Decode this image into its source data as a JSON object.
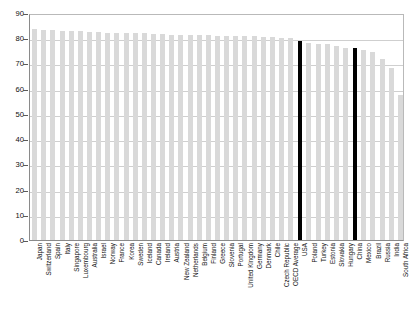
{
  "chart_data": {
    "type": "bar",
    "title": "",
    "xlabel": "",
    "ylabel": "Life expectancy at birth for total population",
    "ylim": [
      0,
      90
    ],
    "yticks": [
      0,
      10,
      20,
      30,
      40,
      50,
      60,
      70,
      80,
      90
    ],
    "grid": true,
    "legend": "none",
    "highlight_color": "#000000",
    "bar_color": "#d9d9d9",
    "highlighted_categories": [
      "USA",
      "China"
    ],
    "categories": [
      "Japan",
      "Switzerland",
      "Spain",
      "Italy",
      "Singapore",
      "Luxembourg",
      "Australia",
      "Israel",
      "Norway",
      "France",
      "Korea",
      "Sweden",
      "Iceland",
      "Canada",
      "Ireland",
      "Austria",
      "New Zealand",
      "Netherlands",
      "Belgium",
      "Finland",
      "Greece",
      "Slovenia",
      "Portugal",
      "United Kingdom",
      "Germany",
      "Denmark",
      "Chile",
      "Czech Republic",
      "OECD Average",
      "USA",
      "Poland",
      "Turkey",
      "Estonia",
      "Slovakia",
      "Hungary",
      "China",
      "Mexico",
      "Brazil",
      "Russia",
      "India",
      "South Africa"
    ],
    "values": [
      83.7,
      83.4,
      83.2,
      83.0,
      82.9,
      82.7,
      82.5,
      82.3,
      82.2,
      82.1,
      82.0,
      82.0,
      81.9,
      81.8,
      81.5,
      81.4,
      81.4,
      81.3,
      81.2,
      81.1,
      81.0,
      80.9,
      80.8,
      80.8,
      80.7,
      80.6,
      80.5,
      80.2,
      80.0,
      78.8,
      78.0,
      77.8,
      77.6,
      76.9,
      76.2,
      76.1,
      75.4,
      74.7,
      71.6,
      68.3,
      57.4
    ]
  }
}
